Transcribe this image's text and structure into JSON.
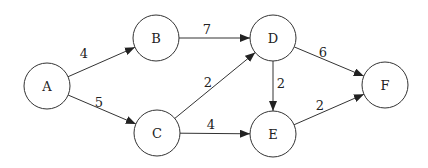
{
  "graph": {
    "type": "directed-weighted",
    "node_radius": 23,
    "colors": {
      "stroke": "#333333",
      "fill": "#ffffff",
      "text": "#222222"
    },
    "nodes": [
      {
        "id": "A",
        "label": "A",
        "x": 47,
        "y": 86
      },
      {
        "id": "B",
        "label": "B",
        "x": 156,
        "y": 38
      },
      {
        "id": "C",
        "label": "C",
        "x": 157,
        "y": 133
      },
      {
        "id": "D",
        "label": "D",
        "x": 273,
        "y": 38
      },
      {
        "id": "E",
        "label": "E",
        "x": 273,
        "y": 134
      },
      {
        "id": "F",
        "label": "F",
        "x": 385,
        "y": 85
      }
    ],
    "edges": [
      {
        "from": "A",
        "to": "B",
        "weight": "4",
        "lx": 84,
        "ly": 53
      },
      {
        "from": "A",
        "to": "C",
        "weight": "5",
        "lx": 99,
        "ly": 102
      },
      {
        "from": "B",
        "to": "D",
        "weight": "7",
        "lx": 207,
        "ly": 29
      },
      {
        "from": "C",
        "to": "D",
        "weight": "2",
        "lx": 208,
        "ly": 82
      },
      {
        "from": "C",
        "to": "E",
        "weight": "4",
        "lx": 211,
        "ly": 124
      },
      {
        "from": "D",
        "to": "E",
        "weight": "2",
        "lx": 281,
        "ly": 83
      },
      {
        "from": "D",
        "to": "F",
        "weight": "6",
        "lx": 323,
        "ly": 52
      },
      {
        "from": "E",
        "to": "F",
        "weight": "2",
        "lx": 320,
        "ly": 105
      }
    ]
  }
}
